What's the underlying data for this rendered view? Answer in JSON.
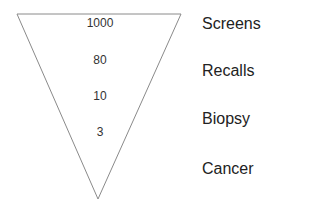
{
  "diagram": {
    "type": "inverted-funnel",
    "stroke_color": "#8a8a8a",
    "levels": [
      {
        "value": "1000",
        "label": "Screens"
      },
      {
        "value": "80",
        "label": "Recalls"
      },
      {
        "value": "10",
        "label": "Biopsy"
      },
      {
        "value": "3",
        "label": "Cancer"
      }
    ]
  }
}
